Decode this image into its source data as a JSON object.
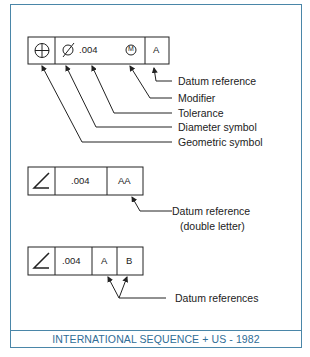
{
  "diagram": {
    "frame1": {
      "cells": [
        "geometric-symbol-position",
        "Ø",
        ".004",
        "M",
        "A"
      ],
      "diameter": "Ø",
      "tolerance": ".004",
      "modifier": "M",
      "datum": "A",
      "labels": [
        "Datum reference",
        "Modifier",
        "Tolerance",
        "Diameter symbol",
        "Geometric symbol"
      ]
    },
    "frame2": {
      "tolerance": ".004",
      "datum": "AA",
      "label_line1": "Datum reference",
      "label_line2": "(double letter)"
    },
    "frame3": {
      "tolerance": ".004",
      "datum1": "A",
      "datum2": "B",
      "label": "Datum references"
    },
    "footer": "INTERNATIONAL SEQUENCE + US - 1982",
    "colors": {
      "border": "#4a86a8",
      "footer_text": "#2f6d96",
      "ink": "#222222"
    }
  }
}
